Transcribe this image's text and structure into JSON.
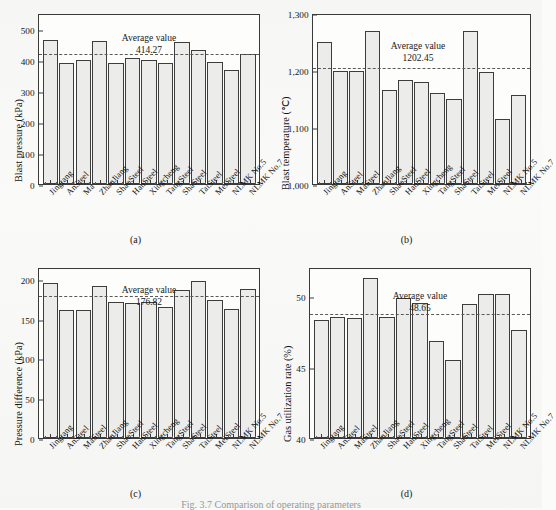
{
  "figure": {
    "caption": "Fig. 3.7  Comparison of operating parameters",
    "panel_ids": [
      "(a)",
      "(b)",
      "(c)",
      "(d)"
    ]
  },
  "categories": [
    "Jingtang",
    "AnSteel",
    "MaSteel",
    "ZhanJiang",
    "ShaoSteel",
    "HanSteel",
    "Xingcheng",
    "TangSteel",
    "ShaSteel",
    "TaiSteel",
    "MeiSteel",
    "NLMK No.5",
    "NLMK No.7"
  ],
  "average_label": "Average value",
  "chart_data": [
    {
      "id": "a",
      "panel_id": "(a)",
      "type": "bar",
      "title": "",
      "xlabel": "",
      "ylabel": "Blast pressure (kPa)",
      "ylim": [
        0,
        550
      ],
      "yticks": [
        0,
        100,
        200,
        300,
        400,
        500
      ],
      "ytick_labels": [
        "0",
        "100",
        "200",
        "300",
        "400",
        "500"
      ],
      "grid": false,
      "legend": "none",
      "categories": [
        "Jingtang",
        "AnSteel",
        "Ma",
        "ZhanJiang",
        "ShaoSteel",
        "HanSteel",
        "Xingcheng",
        "TangSteel",
        "ShaSteel",
        "TaiSteel",
        "MeiSteel",
        "NLMK No.5",
        "NLMK No.7"
      ],
      "values": [
        464,
        388,
        398,
        460,
        389,
        404,
        399,
        390,
        456,
        432,
        394,
        366,
        417
      ],
      "average": 414.27,
      "average_text": "414.27",
      "annotations": [
        "Average value",
        "414.27"
      ]
    },
    {
      "id": "b",
      "panel_id": "(b)",
      "type": "bar",
      "title": "",
      "xlabel": "",
      "ylabel": "Blast temperature (℃)",
      "ylim": [
        1000,
        1300
      ],
      "yticks": [
        1000,
        1100,
        1200,
        1300
      ],
      "ytick_labels": [
        "1,000",
        "1,100",
        "1,200",
        "1,300"
      ],
      "grid": false,
      "legend": "none",
      "categories": [
        "Jingtang",
        "AnSteel",
        "MaSteel",
        "ZhanJiang",
        "ShaoSteel",
        "HanSteel",
        "Xingcheng",
        "TangSteel",
        "ShaSteel",
        "TaiSteel",
        "MeiSteel",
        "NLMK No.5",
        "NLMK No.7"
      ],
      "values": [
        1250,
        1199,
        1199,
        1269,
        1165,
        1183,
        1179,
        1159,
        1150,
        1269,
        1197,
        1114,
        1156
      ],
      "average": 1202.45,
      "average_text": "1202.45",
      "annotations": [
        "Average value",
        "1202.45"
      ]
    },
    {
      "id": "c",
      "panel_id": "(c)",
      "type": "bar",
      "title": "",
      "xlabel": "",
      "ylabel": "Pressure difference (kPa)",
      "ylim": [
        0,
        215
      ],
      "yticks": [
        0,
        50,
        100,
        150,
        200
      ],
      "ytick_labels": [
        "0",
        "50",
        "100",
        "150",
        "200"
      ],
      "grid": false,
      "legend": "none",
      "categories": [
        "Jingtang",
        "AnSteel",
        "MaSteel",
        "ZhanJiang",
        "ShaoSteel",
        "HanSteel",
        "Xingcheng",
        "TangSteel",
        "ShaSteel",
        "TaiSteel",
        "MeiSteel",
        "NLMK No.5",
        "NLMK No.7"
      ],
      "values": [
        195,
        161,
        161,
        191,
        171,
        170,
        171,
        165,
        186,
        198,
        173,
        162,
        187
      ],
      "average": 176.82,
      "average_text": "176.82",
      "annotations": [
        "Average value",
        "176.82"
      ]
    },
    {
      "id": "d",
      "panel_id": "(d)",
      "type": "bar",
      "title": "",
      "xlabel": "",
      "ylabel": "Gas utilization rate (%)",
      "ylim": [
        40,
        52
      ],
      "yticks": [
        40,
        45,
        50
      ],
      "ytick_labels": [
        "40",
        "45",
        "50"
      ],
      "grid": false,
      "legend": "none",
      "categories": [
        "Jingtang",
        "AnSteel",
        "MaSteel",
        "ZhanJiang",
        "ShaoSteel",
        "HanSteel",
        "Xingcheng",
        "TangSteel",
        "ShaSteel",
        "TaiSteel",
        "MeiSteel",
        "NLMK No.5",
        "NLMK No.7"
      ],
      "values": [
        48.3,
        48.5,
        48.4,
        51.2,
        48.5,
        49.8,
        49.5,
        46.8,
        45.5,
        49.4,
        50.1,
        50.1,
        47.6
      ],
      "average": 48.65,
      "average_text": "48.65",
      "annotations": [
        "Average value",
        "48.65"
      ]
    }
  ],
  "colors": {
    "bar_fill": "#ececea",
    "bar_stroke": "#3d3d3d",
    "axis": "#3a3a3a",
    "average_line": "#5a5a5a",
    "text": "#141414",
    "page_background": "#fbfbfa"
  }
}
